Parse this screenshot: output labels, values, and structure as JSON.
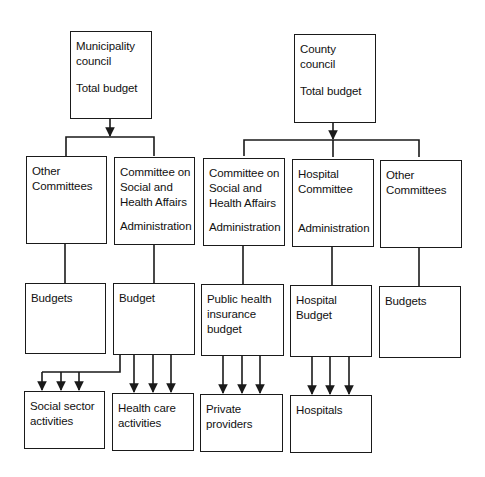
{
  "diagram": {
    "top": {
      "municipality": {
        "lines": [
          "Municipality",
          "council"
        ],
        "sub": "Total budget"
      },
      "county": {
        "lines": [
          "County",
          "council"
        ],
        "sub": "Total budget"
      }
    },
    "committees": [
      {
        "id": "muni-other",
        "lines": [
          "Other",
          "Committees"
        ],
        "sub": ""
      },
      {
        "id": "muni-social",
        "lines": [
          "Committee on",
          "Social and",
          "Health Affairs"
        ],
        "sub": "Administration"
      },
      {
        "id": "county-social",
        "lines": [
          "Committee on",
          "Social and",
          "Health Affairs"
        ],
        "sub": "Administration"
      },
      {
        "id": "county-hospital",
        "lines": [
          "Hospital",
          "Committee"
        ],
        "sub": "Administration"
      },
      {
        "id": "county-other",
        "lines": [
          "Other",
          "Committees"
        ],
        "sub": ""
      }
    ],
    "budgets": [
      {
        "id": "muni-other-budgets",
        "lines": [
          "Budgets"
        ]
      },
      {
        "id": "muni-social-budget",
        "lines": [
          "Budget"
        ]
      },
      {
        "id": "public-health-insurance-budget",
        "lines": [
          "Public health",
          "insurance",
          "budget"
        ]
      },
      {
        "id": "hospital-budget",
        "lines": [
          "Hospital",
          "Budget"
        ]
      },
      {
        "id": "county-other-budgets",
        "lines": [
          "Budgets"
        ]
      }
    ],
    "recipients": [
      {
        "id": "social-sector-activities",
        "lines": [
          "Social sector",
          "activities"
        ]
      },
      {
        "id": "health-care-activities",
        "lines": [
          "Health care",
          "activities"
        ]
      },
      {
        "id": "private-providers",
        "lines": [
          "Private",
          "providers"
        ]
      },
      {
        "id": "hospitals",
        "lines": [
          "Hospitals"
        ]
      }
    ],
    "colors": {
      "line": "#1a1a1a",
      "background": "#ffffff",
      "text": "#111111"
    }
  }
}
